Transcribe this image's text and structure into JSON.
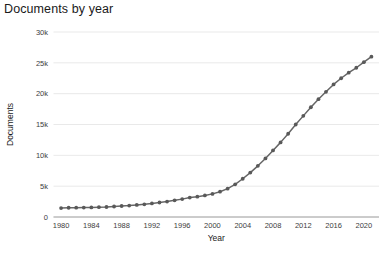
{
  "chart_data": {
    "type": "line",
    "title": "Documents by year",
    "xlabel": "Year",
    "ylabel": "Documents",
    "xlim": [
      1979,
      2022
    ],
    "ylim": [
      0,
      30000
    ],
    "grid": true,
    "legend": false,
    "legend_position": "none",
    "line_color": "#666666",
    "marker_color": "#595959",
    "marker": "circle",
    "x_tick_labels": [
      "1980",
      "1984",
      "1988",
      "1992",
      "1996",
      "2000",
      "2004",
      "2008",
      "2012",
      "2016",
      "2020"
    ],
    "x_tick_values": [
      1980,
      1984,
      1988,
      1992,
      1996,
      2000,
      2004,
      2008,
      2012,
      2016,
      2020
    ],
    "y_tick_labels": [
      "0",
      "5k",
      "10k",
      "15k",
      "20k",
      "25k",
      "30k"
    ],
    "y_tick_values": [
      0,
      5000,
      10000,
      15000,
      20000,
      25000,
      30000
    ],
    "x": [
      1980,
      1981,
      1982,
      1983,
      1984,
      1985,
      1986,
      1987,
      1988,
      1989,
      1990,
      1991,
      1992,
      1993,
      1994,
      1995,
      1996,
      1997,
      1998,
      1999,
      2000,
      2001,
      2002,
      2003,
      2004,
      2005,
      2006,
      2007,
      2008,
      2009,
      2010,
      2011,
      2012,
      2013,
      2014,
      2015,
      2016,
      2017,
      2018,
      2019,
      2020,
      2021
    ],
    "values": [
      1450,
      1500,
      1520,
      1530,
      1560,
      1600,
      1620,
      1700,
      1780,
      1850,
      1950,
      2050,
      2200,
      2350,
      2500,
      2700,
      2900,
      3150,
      3300,
      3500,
      3750,
      4100,
      4600,
      5300,
      6200,
      7200,
      8300,
      9500,
      10800,
      12100,
      13500,
      15000,
      16400,
      17800,
      19100,
      20300,
      21500,
      22500,
      23400,
      24200,
      25100,
      26000
    ]
  }
}
